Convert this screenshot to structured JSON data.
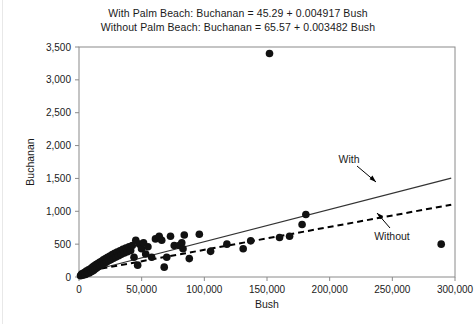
{
  "chart_data": {
    "type": "scatter",
    "title_lines": [
      "With Palm Beach: Buchanan = 45.29 + 0.004917 Bush",
      "Without Palm Beach: Buchanan = 65.57 + 0.003482 Bush"
    ],
    "xlabel": "Bush",
    "ylabel": "Buchanan",
    "xlim": [
      0,
      300000
    ],
    "ylim": [
      0,
      3500
    ],
    "xticks": [
      0,
      50000,
      100000,
      150000,
      200000,
      250000,
      300000
    ],
    "xtick_labels": [
      "0",
      "50,000",
      "100,000",
      "150,000",
      "200,000",
      "250,000",
      "300,000"
    ],
    "yticks": [
      0,
      500,
      1000,
      1500,
      2000,
      2500,
      3000,
      3500
    ],
    "ytick_labels": [
      "0",
      "500",
      "1,000",
      "1,500",
      "2,000",
      "2,500",
      "3,000",
      "3,500"
    ],
    "grid": false,
    "legend_position": "inline-annotations",
    "marker_color": "#111111",
    "marker_size": 5,
    "points": [
      [
        1200,
        20
      ],
      [
        1800,
        35
      ],
      [
        2400,
        50
      ],
      [
        3100,
        28
      ],
      [
        3600,
        60
      ],
      [
        4100,
        45
      ],
      [
        4800,
        70
      ],
      [
        5200,
        38
      ],
      [
        5900,
        90
      ],
      [
        6400,
        55
      ],
      [
        7000,
        75
      ],
      [
        7600,
        110
      ],
      [
        8200,
        62
      ],
      [
        8800,
        95
      ],
      [
        9400,
        130
      ],
      [
        10100,
        85
      ],
      [
        10800,
        150
      ],
      [
        11500,
        100
      ],
      [
        12200,
        170
      ],
      [
        12900,
        120
      ],
      [
        13600,
        190
      ],
      [
        14300,
        140
      ],
      [
        15000,
        205
      ],
      [
        15800,
        160
      ],
      [
        16500,
        225
      ],
      [
        17200,
        175
      ],
      [
        18000,
        240
      ],
      [
        18800,
        195
      ],
      [
        19500,
        260
      ],
      [
        20300,
        210
      ],
      [
        21200,
        280
      ],
      [
        22000,
        230
      ],
      [
        22900,
        300
      ],
      [
        23800,
        250
      ],
      [
        24700,
        320
      ],
      [
        25600,
        265
      ],
      [
        26600,
        340
      ],
      [
        27500,
        285
      ],
      [
        28500,
        360
      ],
      [
        29500,
        305
      ],
      [
        30500,
        380
      ],
      [
        31600,
        325
      ],
      [
        32700,
        400
      ],
      [
        33800,
        345
      ],
      [
        35000,
        420
      ],
      [
        36200,
        365
      ],
      [
        37400,
        440
      ],
      [
        38600,
        385
      ],
      [
        39900,
        460
      ],
      [
        41200,
        405
      ],
      [
        42500,
        480
      ],
      [
        43900,
        300
      ],
      [
        45300,
        560
      ],
      [
        46800,
        180
      ],
      [
        48300,
        500
      ],
      [
        49900,
        430
      ],
      [
        51500,
        520
      ],
      [
        53200,
        350
      ],
      [
        55000,
        460
      ],
      [
        58000,
        300
      ],
      [
        61000,
        580
      ],
      [
        64000,
        620
      ],
      [
        66000,
        560
      ],
      [
        68000,
        150
      ],
      [
        70000,
        300
      ],
      [
        73000,
        620
      ],
      [
        76000,
        480
      ],
      [
        80000,
        480
      ],
      [
        82000,
        520
      ],
      [
        83000,
        430
      ],
      [
        84000,
        640
      ],
      [
        88000,
        280
      ],
      [
        96000,
        650
      ],
      [
        105000,
        390
      ],
      [
        118000,
        500
      ],
      [
        131000,
        430
      ],
      [
        137000,
        550
      ],
      [
        152000,
        3400
      ],
      [
        160000,
        600
      ],
      [
        168000,
        620
      ],
      [
        178000,
        800
      ],
      [
        181000,
        950
      ],
      [
        289000,
        500
      ]
    ],
    "outlier_note": "Palm Beach County outlier near (152,000, 3,400)",
    "fit_lines": [
      {
        "name": "With",
        "label": "With",
        "style": "solid",
        "intercept": 45.29,
        "slope": 0.004917,
        "x_start": 10000,
        "x_end": 297000,
        "color": "#333333"
      },
      {
        "name": "Without",
        "label": "Without",
        "style": "dashed",
        "intercept": 65.57,
        "slope": 0.003482,
        "x_start": 10000,
        "x_end": 297000,
        "color": "#000000"
      }
    ],
    "annotations": [
      {
        "text": "With",
        "x": 190000,
        "y": 1630
      },
      {
        "text": "Without",
        "x": 196000,
        "y": 640
      }
    ]
  }
}
